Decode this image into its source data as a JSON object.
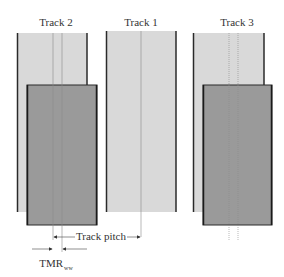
{
  "diagram": {
    "tracks": [
      {
        "label": "Track 2",
        "label_x": 56,
        "light": {
          "x": 17,
          "y": 33,
          "w": 70,
          "h": 179
        },
        "head": {
          "x": 27,
          "y": 85,
          "w": 70,
          "h": 140
        },
        "center_lines": [
          53,
          62
        ]
      },
      {
        "label": "Track 1",
        "label_x": 141,
        "light": {
          "x": 106,
          "y": 31,
          "w": 70,
          "h": 181
        },
        "center_lines": [
          141
        ]
      },
      {
        "label": "Track 3",
        "label_x": 237,
        "light": {
          "x": 193,
          "y": 33,
          "w": 71,
          "h": 179
        },
        "head": {
          "x": 203,
          "y": 85,
          "w": 69,
          "h": 140
        },
        "center_lines": [
          229,
          238
        ]
      }
    ],
    "annotations": {
      "track_pitch": {
        "label": "Track pitch",
        "from_x": 53,
        "to_x": 141,
        "y": 237
      },
      "tmr": {
        "label": "TMR",
        "subscript": "ww",
        "left_x": 53,
        "right_x": 62,
        "y": 249
      }
    },
    "colors": {
      "track_fill": "#d9d9d9",
      "head_fill": "#9a9a9a",
      "edge": "#2a2a2a",
      "center_line": "#8a8a8a",
      "arrow": "#444444"
    }
  }
}
